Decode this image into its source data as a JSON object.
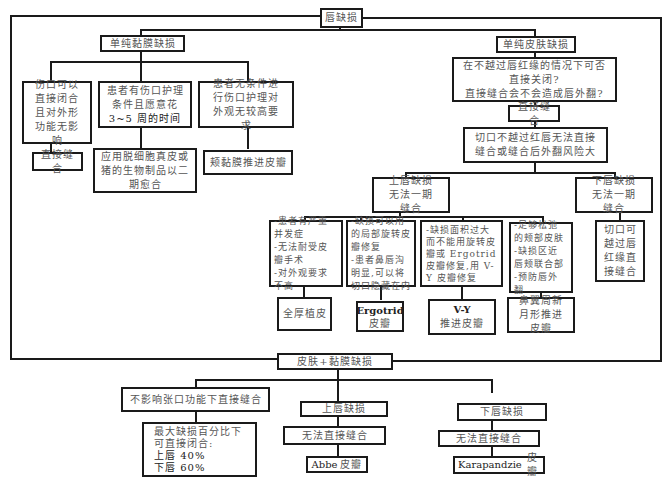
{
  "root": "唇缺损",
  "mucosa": {
    "title": "单纯黏膜缺损",
    "options": [
      {
        "condition": "伤口可以直接闭合且对外形功能无影响",
        "action": "直接缝合"
      },
      {
        "condition_lines": [
          "患者有伤口护理",
          "条件且愿意花",
          "3~5 周的时间"
        ],
        "action": "应用脱细胞真皮或猪的生物制品以二期愈合"
      },
      {
        "condition": "患者无条件进行伤口护理对外观无较高要求",
        "action": "颊黏膜推进皮瓣"
      }
    ]
  },
  "skin": {
    "title": "单纯皮肤缺损",
    "question_lines": [
      "在不越过唇红缘的情况下可否",
      "直接关闭?",
      "直接缝合会不会造成唇外翻?"
    ],
    "direct": "直接缝合",
    "risk": "切口不越过红唇无法直接缝合或缝合后外翻风险大",
    "upper": {
      "title": "上唇缺损无法一期缝合",
      "options": [
        {
          "criteria": [
            "-患者有严重并发症",
            "-无法耐受皮瓣手术",
            "-对外观要求不高"
          ],
          "action": "全厚植皮"
        },
        {
          "criteria": [
            "-缺损可以用的局部旋转皮瓣修复",
            "-患者鼻唇沟明显,可以将切口隐藏在内"
          ],
          "action_latin": "Ergotrid",
          "action": "皮瓣"
        },
        {
          "criteria": [
            "-缺损面积过大而不能用旋转皮瓣或 Ergotrid 皮瓣修复,用 V-Y 皮瓣修复"
          ],
          "action_latin": "V-Y",
          "action": "推进皮瓣"
        },
        {
          "criteria": [
            "-足够松弛的颊部皮肤",
            "-缺损区近唇颊联合部",
            "-预防唇外翻"
          ],
          "action": "鼻翼周新月形推进皮瓣"
        }
      ]
    },
    "lower": {
      "title": "下唇缺损无法一期缝合",
      "action": "切口可越过唇红缘直接缝合"
    }
  },
  "combined": {
    "title": "皮肤+黏膜缺损",
    "direct": {
      "title": "不影响张口功能下直接缝合",
      "detail_lines": [
        "最大缺损百分比下",
        "可直接闭合:",
        "上唇 40%",
        "下唇 60%"
      ]
    },
    "upper": {
      "title": "上唇缺损",
      "step": "无法直接缝合",
      "action_latin": "Abbe",
      "action": "皮瓣"
    },
    "lower": {
      "title": "下唇缺损",
      "step": "无法直接缝合",
      "action_latin": "Karapandzie",
      "action": "皮瓣"
    }
  }
}
